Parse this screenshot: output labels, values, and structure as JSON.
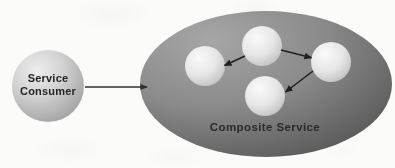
{
  "diagram": {
    "background_color": "#fbfbfa",
    "consumer": {
      "id": "service-consumer",
      "label_line1": "Service",
      "label_line2": "Consumer",
      "shape": "circle",
      "cx": 48,
      "cy": 86,
      "r": 36,
      "fill_light": "#e9e9e9",
      "fill_dark": "#a9a9a9",
      "text_color": "#262626"
    },
    "composite": {
      "id": "composite-service",
      "label": "Composite Service",
      "shape": "ellipse",
      "cx": 266,
      "cy": 84,
      "rx": 126,
      "ry": 73,
      "fill_light": "#9c9c9c",
      "fill_dark": "#5e5e5e",
      "text_color": "#1f1f1f",
      "label_x": 265,
      "label_y": 131
    },
    "inner_nodes": [
      {
        "id": "node-top",
        "name": "inner-service-top",
        "cx": 262,
        "cy": 46,
        "r": 20,
        "fill_light": "#f3f3f3",
        "fill_dark": "#c3c3c3"
      },
      {
        "id": "node-left",
        "name": "inner-service-left",
        "cx": 205,
        "cy": 66,
        "r": 20,
        "fill_light": "#f2f2f2",
        "fill_dark": "#c0c0c0"
      },
      {
        "id": "node-right",
        "name": "inner-service-right",
        "cx": 331,
        "cy": 62,
        "r": 20,
        "fill_light": "#f3f3f3",
        "fill_dark": "#c2c2c2"
      },
      {
        "id": "node-bottom",
        "name": "inner-service-bottom",
        "cx": 265,
        "cy": 96,
        "r": 20,
        "fill_light": "#f2f2f2",
        "fill_dark": "#c1c1c1"
      }
    ],
    "connectors": [
      {
        "id": "arrow-consumer-to-composite",
        "name": "arrow-consumer-to-composite",
        "from": "service-consumer",
        "to": "composite-service",
        "x1": 85,
        "y1": 87,
        "x2": 148,
        "y2": 87,
        "color": "#2f2f2f"
      },
      {
        "id": "arrow-top-to-left",
        "name": "arrow-top-to-left",
        "from": "node-top",
        "to": "node-left",
        "x1": 245,
        "y1": 56,
        "x2": 223,
        "y2": 66,
        "color": "#1f1f1f"
      },
      {
        "id": "arrow-top-to-right",
        "name": "arrow-top-to-right",
        "from": "node-top",
        "to": "node-right",
        "x1": 281,
        "y1": 50,
        "x2": 312,
        "y2": 58,
        "color": "#1f1f1f"
      },
      {
        "id": "arrow-right-to-bottom",
        "name": "arrow-right-to-bottom",
        "from": "node-right",
        "to": "node-bottom",
        "x1": 313,
        "y1": 71,
        "x2": 285,
        "y2": 92,
        "color": "#1f1f1f"
      }
    ]
  }
}
